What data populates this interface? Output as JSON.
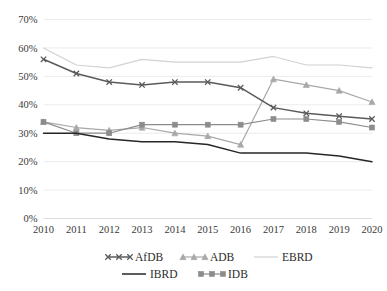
{
  "chart_data": {
    "type": "line",
    "title": "",
    "subtitle": "",
    "xlabel": "",
    "ylabel": "",
    "x": [
      2010,
      2011,
      2012,
      2013,
      2014,
      2015,
      2016,
      2017,
      2018,
      2019,
      2020
    ],
    "categories": [
      "2010",
      "2011",
      "2012",
      "2013",
      "2014",
      "2015",
      "2016",
      "2017",
      "2018",
      "2019",
      "2020"
    ],
    "xtick_labels": [
      "2010",
      "2011",
      "2012",
      "2013",
      "2014",
      "2015",
      "2016",
      "2017",
      "2018",
      "2019",
      "2020"
    ],
    "ytick_labels": [
      "0%",
      "10%",
      "20%",
      "30%",
      "40%",
      "50%",
      "60%",
      "70%"
    ],
    "ytick_values": [
      0,
      10,
      20,
      30,
      40,
      50,
      60,
      70
    ],
    "ylim": [
      0,
      70
    ],
    "xlim": [
      2010,
      2020
    ],
    "grid": true,
    "grid_axis": "y",
    "legend_position": "bottom",
    "legend": [
      "AfDB",
      "ADB",
      "EBRD",
      "IBRD",
      "IDB"
    ],
    "series": [
      {
        "name": "AfDB",
        "marker": "x",
        "color": "#5a5a5a",
        "values": [
          56,
          51,
          48,
          47,
          48,
          48,
          46,
          39,
          37,
          36,
          35
        ]
      },
      {
        "name": "ADB",
        "marker": "triangle",
        "color": "#a8a8a8",
        "values": [
          34,
          32,
          31,
          32,
          30,
          29,
          26,
          49,
          47,
          45,
          41
        ]
      },
      {
        "name": "EBRD",
        "marker": "none",
        "color": "#d2d2d2",
        "values": [
          60,
          54,
          53,
          56,
          55,
          55,
          55,
          57,
          54,
          54,
          53
        ]
      },
      {
        "name": "IBRD",
        "marker": "none",
        "color": "#262626",
        "values": [
          30,
          30,
          28,
          27,
          27,
          26,
          23,
          23,
          23,
          22,
          20
        ]
      },
      {
        "name": "IDB",
        "marker": "square",
        "color": "#8c8c8c",
        "values": [
          34,
          30,
          30,
          33,
          33,
          33,
          33,
          35,
          35,
          34,
          32
        ]
      }
    ]
  }
}
